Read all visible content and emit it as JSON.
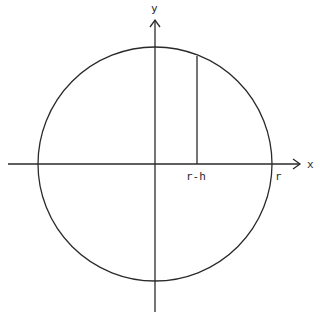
{
  "diagram": {
    "type": "circle-with-axes",
    "colors": {
      "stroke": "#2a2a2a",
      "background": "#ffffff"
    },
    "axes": {
      "x_label": "x",
      "y_label": "y"
    },
    "labels": {
      "chord_position": "r-h",
      "radius": "r"
    },
    "geometry": {
      "center": [
        155,
        164
      ],
      "radius": 117,
      "chord_x": 197
    }
  }
}
